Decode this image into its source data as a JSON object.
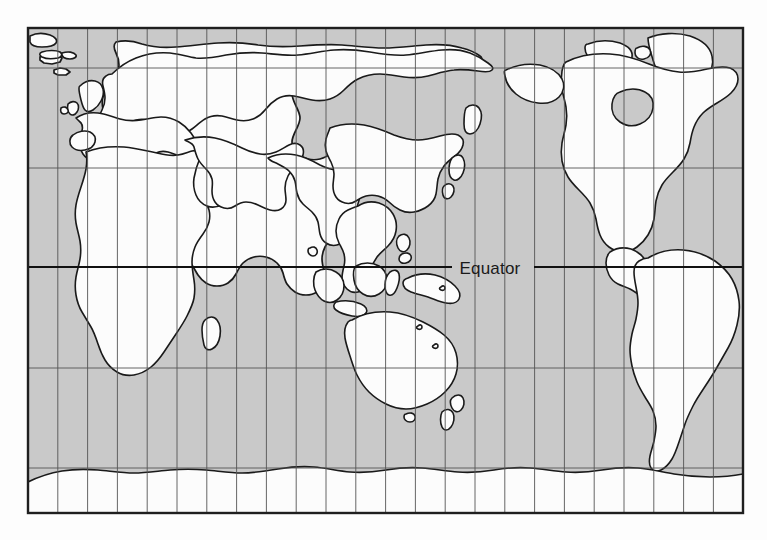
{
  "figure": {
    "kind": "world-map",
    "projection": "cylindrical",
    "page_background": "#fdfdfd"
  },
  "map": {
    "frame": {
      "x": 28,
      "y": 28,
      "width": 715,
      "height": 485,
      "border_color": "#1f1f1f",
      "border_width_px": 2.4
    },
    "ocean_color": "#c9c9c9",
    "land_color": "#fcfcfc",
    "coastline_color": "#1a1a1a",
    "graticule": {
      "meridian_color": "#555555",
      "parallel_color": "#555555",
      "line_width_px": 0.9,
      "meridian_count": 23,
      "meridian_spacing_px": 29.79,
      "parallel_y_positions": [
        68,
        168,
        368,
        468
      ]
    },
    "equator": {
      "label": "Equator",
      "label_x": 490,
      "label_y": 274,
      "line_y": 267,
      "line_color": "#111111",
      "line_width_px": 2.2,
      "label_gap_start_x": 452,
      "label_gap_end_x": 534
    }
  }
}
